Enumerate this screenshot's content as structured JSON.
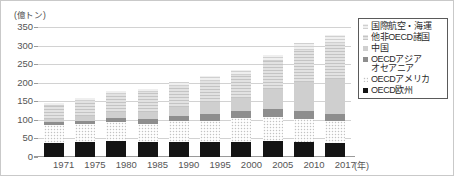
{
  "chart_data": {
    "type": "bar",
    "stacked": true,
    "title": "",
    "subtitle": "",
    "xlabel": "(年)",
    "ylabel": "(億トン)",
    "unit_label": "(億トン)",
    "categories": [
      "1971",
      "1975",
      "1980",
      "1985",
      "1990",
      "1995",
      "2000",
      "2005",
      "2010",
      "2017"
    ],
    "ylim": [
      0,
      350
    ],
    "yticks": [
      0,
      50,
      100,
      150,
      200,
      250,
      300,
      350
    ],
    "grid": true,
    "legend_position": "right",
    "series": [
      {
        "name": "OECD欧州",
        "color": "#141414",
        "values": [
          38,
          40,
          42,
          40,
          41,
          40,
          41,
          42,
          40,
          38
        ]
      },
      {
        "name": "OECDアメリカ",
        "color": "#c2c2c2",
        "values": [
          47,
          48,
          52,
          50,
          55,
          58,
          64,
          65,
          62,
          58
        ]
      },
      {
        "name": "OECDアジアオセアニア",
        "color": "#8e8e8e",
        "values": [
          8,
          10,
          12,
          13,
          15,
          18,
          20,
          21,
          22,
          21
        ]
      },
      {
        "name": "中国",
        "color": "#cfcfcf",
        "values": [
          9,
          12,
          16,
          19,
          24,
          31,
          34,
          55,
          79,
          93
        ]
      },
      {
        "name": "他非OECD諸国",
        "color": "#d8d8d8",
        "values": [
          36,
          42,
          48,
          52,
          57,
          58,
          63,
          75,
          85,
          98
        ]
      },
      {
        "name": "国際航空・海運",
        "color": "#e6e6e6",
        "values": [
          7,
          8,
          9,
          9,
          11,
          12,
          13,
          16,
          18,
          20
        ]
      }
    ],
    "totals": [
      145,
      160,
      179,
      183,
      203,
      217,
      235,
      274,
      306,
      328
    ]
  },
  "legend": {
    "items": [
      {
        "label": "国際航空・海運",
        "swatch_name": "legend-swatch-international-aviation-shipping"
      },
      {
        "label": "他非OECD諸国",
        "swatch_name": "legend-swatch-other-non-oecd"
      },
      {
        "label": "中国",
        "swatch_name": "legend-swatch-china"
      },
      {
        "label": "OECDアジア\nオセアニア",
        "swatch_name": "legend-swatch-oecd-asia-oceania"
      },
      {
        "label": "OECDアメリカ",
        "swatch_name": "legend-swatch-oecd-americas"
      },
      {
        "label": "OECD欧州",
        "swatch_name": "legend-swatch-oecd-europe"
      }
    ]
  },
  "axes": {
    "y_unit": "(億トン)",
    "x_unit": "(年)",
    "y_ticks": [
      "350",
      "300",
      "250",
      "200",
      "150",
      "100",
      "50",
      "0"
    ],
    "x_ticks": [
      "1971",
      "1975",
      "1980",
      "1985",
      "1990",
      "1995",
      "2000",
      "2005",
      "2010",
      "2017"
    ]
  }
}
